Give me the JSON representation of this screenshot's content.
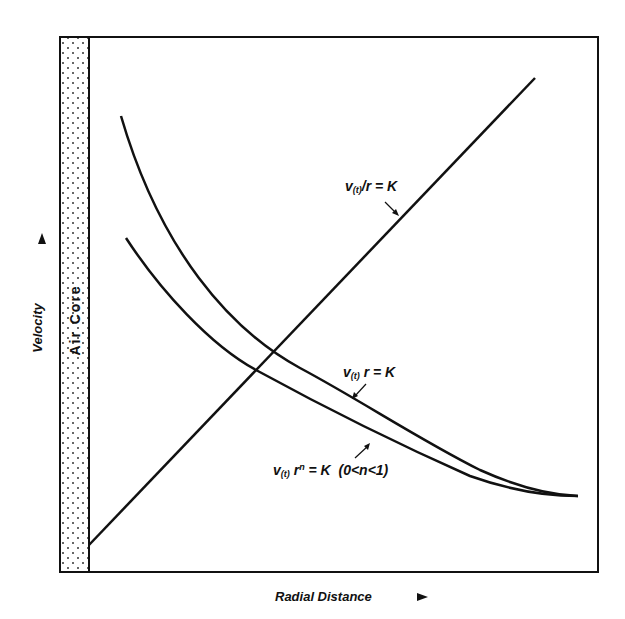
{
  "figure": {
    "region_label": "Air Core",
    "x_axis_label": "Radial Distance",
    "y_axis_label": "Velocity",
    "curves": [
      {
        "id": "forced-vortex",
        "label": "v(t)/r = K",
        "label_main": "v",
        "label_sub": "(t)",
        "label_rest": "/r = K",
        "shape": "straight line rising"
      },
      {
        "id": "free-vortex",
        "label": "v(t) r = K",
        "label_main": "v",
        "label_sub": "(t)",
        "label_rest": " r = K",
        "shape": "hyperbolic decay (upper)"
      },
      {
        "id": "real-vortex",
        "label": "v(t) r^n = K (0<n<1)",
        "label_main": "v",
        "label_sub": "(t)",
        "label_rest_a": " r",
        "label_sup": "n",
        "label_rest_b": " = K  (0<n<1)",
        "shape": "power-law decay (lower)"
      }
    ]
  },
  "colors": {
    "ink": "#111111",
    "background": "#ffffff"
  }
}
